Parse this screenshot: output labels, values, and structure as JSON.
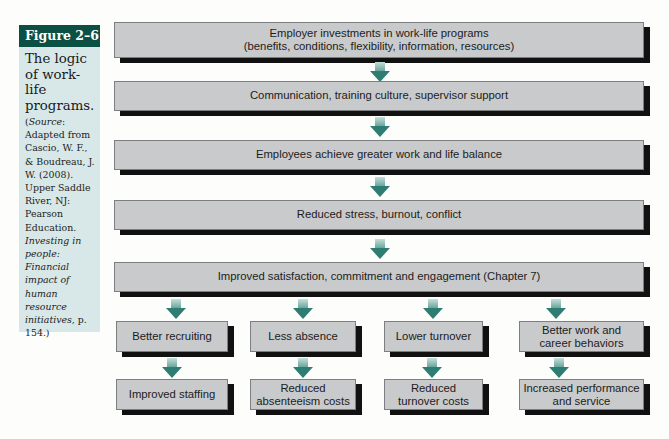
{
  "figure": {
    "label": "Figure 2–6",
    "title": "The logic of work-life programs.",
    "source_prefix": "(",
    "source_word": "Source",
    "source_text": ": Adapted from Cascio, W. F., & Boudreau, J. W. (2008). Upper Saddle River, NJ: Pearson Education. ",
    "source_book": "Investing in people: Financial impact of human resource initiatives,",
    "source_page": " p. 154.)"
  },
  "colors": {
    "figure_label_bg": "#0c4f43",
    "sidebar_bg": "#d8e8e8",
    "box_fill": "#c9cacb",
    "box_shadow": "#111111",
    "arrow": "#2f7d72"
  },
  "flow": {
    "main": [
      {
        "line1": "Employer investments in work-life programs",
        "line2": "(benefits, conditions, flexibility, information, resources)"
      },
      {
        "line1": "Communication, training culture, supervisor support",
        "line2": ""
      },
      {
        "line1": "Employees achieve greater work and life balance",
        "line2": ""
      },
      {
        "line1": "Reduced stress, burnout, conflict",
        "line2": ""
      },
      {
        "line1": "Improved satisfaction, commitment and engagement (Chapter 7)",
        "line2": ""
      }
    ],
    "branches": [
      {
        "outcome": [
          "Better recruiting",
          ""
        ],
        "result": [
          "Improved staffing",
          ""
        ]
      },
      {
        "outcome": [
          "Less absence",
          ""
        ],
        "result": [
          "Reduced",
          "absenteeism costs"
        ]
      },
      {
        "outcome": [
          "Lower turnover",
          ""
        ],
        "result": [
          "Reduced",
          "turnover costs"
        ]
      },
      {
        "outcome": [
          "Better work and",
          "career behaviors"
        ],
        "result": [
          "Increased performance",
          "and service"
        ]
      }
    ]
  }
}
